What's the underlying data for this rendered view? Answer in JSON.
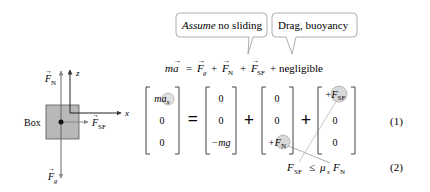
{
  "callouts": {
    "assume": {
      "italic": "Assume",
      "rest": " no sliding"
    },
    "drag": {
      "text": "Drag, buoyancy"
    }
  },
  "equation": {
    "lhs": "ma",
    "eq": "=",
    "terms": [
      "F",
      "g",
      "+",
      "F",
      "N",
      "+",
      "F",
      "SF"
    ],
    "tail": "+ negligible"
  },
  "fbd": {
    "box_label": "Box",
    "fn_label": "F",
    "fn_sub": "N",
    "fg_label": "F",
    "fg_sub": "g",
    "fsf_label": "F",
    "fsf_sub": "SF",
    "z_axis": "z",
    "x_axis": "x",
    "box_color": "#b8b8b8"
  },
  "matrices": {
    "lhs": [
      "ma_x",
      "0",
      "0"
    ],
    "gravity": [
      "0",
      "0",
      "−mg"
    ],
    "normal": [
      "0",
      "0",
      "+F_N"
    ],
    "friction": [
      "+F_SF",
      "0",
      "0"
    ],
    "equals": "=",
    "plus": "+"
  },
  "constraint": {
    "lhs": "F",
    "lhs_sub": "SF",
    "op": "≤",
    "mu": "μ",
    "mu_sub": "s",
    "rhs": "F",
    "rhs_sub": "N"
  },
  "equation_numbers": [
    "(1)",
    "(2)"
  ],
  "highlight_color": "#d9d9d9"
}
